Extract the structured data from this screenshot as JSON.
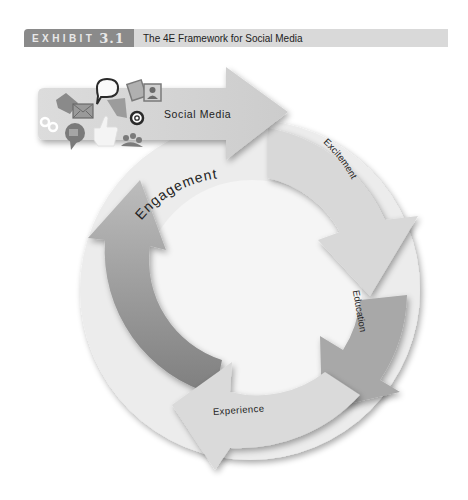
{
  "header": {
    "exhibit_label": "EXHIBIT",
    "exhibit_number": "3.1",
    "title": "The 4E Framework for Social Media"
  },
  "diagram": {
    "type": "cycle",
    "entry_arrow": {
      "label": "Social Media",
      "icons": [
        "tag-icon",
        "envelope-icon",
        "speech-bubble-icon",
        "chat-bubble-icon",
        "link-icon",
        "video-chat-icon",
        "thumbs-up-icon",
        "at-sign-icon",
        "photo-icon",
        "profile-icon",
        "people-icon"
      ]
    },
    "stages": [
      {
        "label": "Excitement",
        "position": "top-right",
        "color": "#d6d6d6"
      },
      {
        "label": "Education",
        "position": "right",
        "color": "#a9a9a9"
      },
      {
        "label": "Experience",
        "position": "bottom",
        "color": "#d9d9d9"
      },
      {
        "label": "Engagement",
        "position": "left",
        "color": "#8f8f8f"
      }
    ],
    "colors": {
      "background_circle": "#ebebeb",
      "entry_arrow": "#cfcfcf",
      "exhibit_tab": "#8a8a8a",
      "header_bar": "#d9d9d9"
    }
  }
}
